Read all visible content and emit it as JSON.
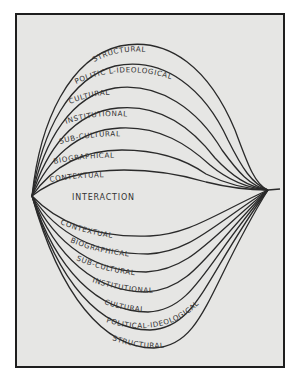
{
  "diagram": {
    "center_label": "INTERACTION",
    "upper_layers": [
      {
        "label": "STRUCTURAL"
      },
      {
        "label": "POLITIC L-IDEOLOGICAL"
      },
      {
        "label": "CULTURAL"
      },
      {
        "label": "INSTITUTIONAL"
      },
      {
        "label": "SUB-CULTURAL"
      },
      {
        "label": "BIOGRAPHICAL"
      },
      {
        "label": "CONTEXTUAL"
      }
    ],
    "lower_layers": [
      {
        "label": "CONTEXTUAL"
      },
      {
        "label": "BIOGRAPHICAL"
      },
      {
        "label": "SUB-CULTURAL"
      },
      {
        "label": "INSTITUTIONAL"
      },
      {
        "label": "CULTURAL"
      },
      {
        "label": "POLITICAL-IDEOLOGICAL"
      },
      {
        "label": "STRUCTURAL"
      }
    ],
    "colors": {
      "background": "#e6e6e4",
      "ink": "#2a2a2a",
      "frame": "#1e1e1e"
    }
  }
}
